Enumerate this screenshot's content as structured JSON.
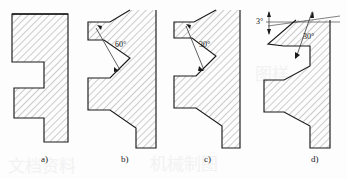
{
  "figure": {
    "background_color": "#fdfdfd",
    "line_color": "#1a1a1a",
    "hatch_color": "#8a8a8a",
    "panels": [
      {
        "id": "a",
        "caption": "a)",
        "profile_name": "square-thread-profile",
        "angle_labels": []
      },
      {
        "id": "b",
        "caption": "b)",
        "profile_name": "v-thread-profile",
        "angle_labels": [
          {
            "name": "angle-label-60",
            "text": "60°"
          }
        ]
      },
      {
        "id": "c",
        "caption": "c)",
        "profile_name": "trapezoidal-thread-profile",
        "angle_labels": [
          {
            "name": "angle-label-30",
            "text": "30°"
          }
        ]
      },
      {
        "id": "d",
        "caption": "d)",
        "profile_name": "buttress-thread-profile",
        "angle_labels": [
          {
            "name": "angle-label-3",
            "text": "3°"
          },
          {
            "name": "angle-label-30",
            "text": "30°"
          }
        ]
      }
    ]
  }
}
